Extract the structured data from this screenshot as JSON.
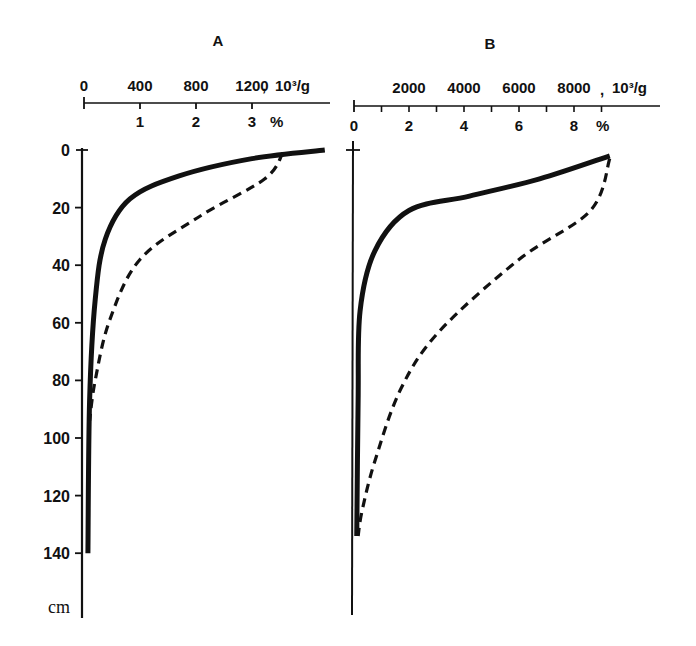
{
  "chart_data": [
    {
      "type": "line",
      "title": "A",
      "top_axis_label": "10³/g",
      "top_axis_ticks": [
        "0",
        "400",
        "800",
        "1200"
      ],
      "bottom_axis_label": "%",
      "bottom_axis_ticks": [
        "1",
        "2",
        "3"
      ],
      "ylabel": "cm",
      "y_ticks": [
        "0",
        "20",
        "40",
        "60",
        "80",
        "100",
        "120",
        "140"
      ],
      "ylim": [
        0,
        150
      ],
      "xlim_percent": [
        0,
        4.4
      ],
      "y_inverted": true,
      "series": [
        {
          "name": "solid",
          "style": "solid",
          "points": [
            [
              4.3,
              0
            ],
            [
              3.0,
              3
            ],
            [
              1.7,
              9
            ],
            [
              0.82,
              17
            ],
            [
              0.38,
              31
            ],
            [
              0.2,
              52
            ],
            [
              0.1,
              87
            ],
            [
              0.07,
              140
            ]
          ]
        },
        {
          "name": "dashed",
          "style": "dashed",
          "points": [
            [
              3.55,
              1
            ],
            [
              3.23,
              10
            ],
            [
              2.07,
              23
            ],
            [
              1.0,
              38
            ],
            [
              0.46,
              59
            ],
            [
              0.2,
              80
            ],
            [
              0.1,
              94
            ]
          ]
        }
      ]
    },
    {
      "type": "line",
      "title": "B",
      "top_axis_label": "10³/g",
      "top_axis_ticks": [
        "2000",
        "4000",
        "6000",
        "8000"
      ],
      "bottom_axis_label": "%",
      "bottom_axis_ticks": [
        "0",
        "2",
        "4",
        "6",
        "8"
      ],
      "ylim": [
        0,
        150
      ],
      "xlim_percent": [
        0,
        11
      ],
      "y_inverted": true,
      "series": [
        {
          "name": "solid",
          "style": "solid",
          "points": [
            [
              9.3,
              2
            ],
            [
              6.75,
              10
            ],
            [
              4.2,
              16
            ],
            [
              2.0,
              21
            ],
            [
              0.76,
              35
            ],
            [
              0.22,
              56
            ],
            [
              0.15,
              87
            ],
            [
              0.1,
              134
            ]
          ]
        },
        {
          "name": "dashed",
          "style": "dashed",
          "points": [
            [
              9.3,
              3
            ],
            [
              8.6,
              21
            ],
            [
              6.0,
              38
            ],
            [
              3.1,
              63
            ],
            [
              1.7,
              83
            ],
            [
              0.76,
              108
            ],
            [
              0.3,
              125
            ],
            [
              0.15,
              134
            ]
          ]
        }
      ]
    }
  ],
  "panels": {
    "a": {
      "title": "A",
      "top_unit": "10³/g",
      "bottom_unit": "%",
      "depth_unit": "cm"
    },
    "b": {
      "title": "B",
      "top_unit": "10³/g",
      "bottom_unit": "%"
    }
  }
}
